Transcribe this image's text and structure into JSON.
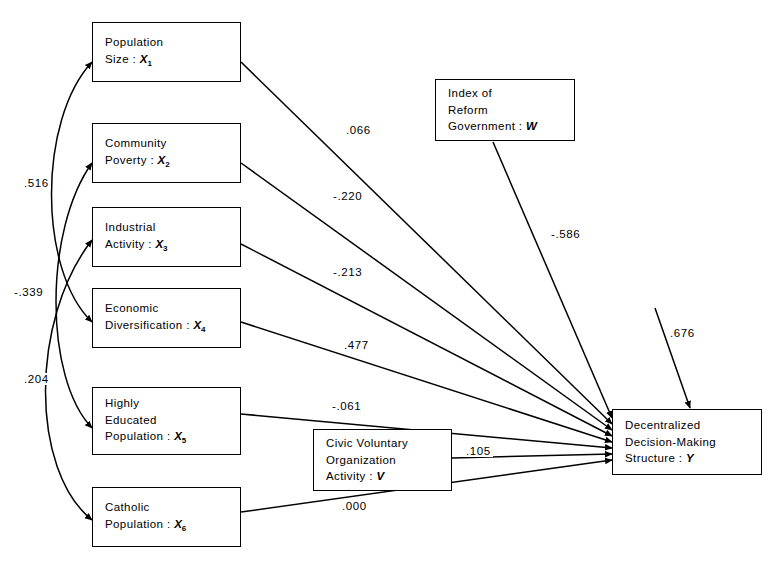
{
  "diagram": {
    "type": "path-analysis-diagram",
    "exogenous_nodes": [
      {
        "id": "X1",
        "lines": [
          "Population",
          "Size : X1"
        ],
        "label_prefix": "Population",
        "label_second": "Size :",
        "symbol": "X",
        "subscript": "1"
      },
      {
        "id": "X2",
        "lines": [
          "Community",
          "Poverty : X2"
        ],
        "label_prefix": "Community",
        "label_second": "Poverty :",
        "symbol": "X",
        "subscript": "2"
      },
      {
        "id": "X3",
        "lines": [
          "Industrial",
          "Activity : X3"
        ],
        "label_prefix": "Industrial",
        "label_second": "Activity :",
        "symbol": "X",
        "subscript": "3"
      },
      {
        "id": "X4",
        "lines": [
          "Economic",
          "Diversification : X4"
        ],
        "label_prefix": "Economic",
        "label_second": "Diversification :",
        "symbol": "X",
        "subscript": "4"
      },
      {
        "id": "X5",
        "lines": [
          "Highly",
          "Educated",
          "Population : X5"
        ],
        "label_prefix": "Highly",
        "label_mid": "Educated",
        "label_second": "Population :",
        "symbol": "X",
        "subscript": "5"
      },
      {
        "id": "X6",
        "lines": [
          "Catholic",
          "Population : X6"
        ],
        "label_prefix": "Catholic",
        "label_second": "Population :",
        "symbol": "X",
        "subscript": "6"
      }
    ],
    "node_w": {
      "line1": "Index of",
      "line2": "Reform",
      "line3": "Government :",
      "symbol": "W"
    },
    "node_v": {
      "line1": "Civic Voluntary",
      "line2": "Organization",
      "line3": "Activity :",
      "symbol": "V"
    },
    "node_y": {
      "line1": "Decentralized",
      "line2": "Decision-Making",
      "line3": "Structure :",
      "symbol": "Y"
    },
    "correlations": [
      {
        "value": ".516",
        "from": "X1",
        "to": "X4"
      },
      {
        "value": "-.339",
        "from": "X2",
        "to": "X5"
      },
      {
        "value": ".204",
        "from": "X3",
        "to": "X6"
      }
    ],
    "path_coefficients": [
      {
        "value": ".066",
        "from": "X1",
        "to": "Y"
      },
      {
        "value": "-.220",
        "from": "X2",
        "to": "Y"
      },
      {
        "value": "-.213",
        "from": "X3",
        "to": "Y"
      },
      {
        "value": ".477",
        "from": "X4",
        "to": "Y"
      },
      {
        "value": "-.061",
        "from": "X5",
        "to": "Y"
      },
      {
        "value": ".105",
        "from": "V",
        "to": "Y"
      },
      {
        "value": ".000",
        "from": "X6",
        "to": "Y"
      },
      {
        "value": "-.586",
        "from": "W",
        "to": "Y"
      }
    ],
    "residual": {
      "value": ".676",
      "to": "Y"
    }
  }
}
